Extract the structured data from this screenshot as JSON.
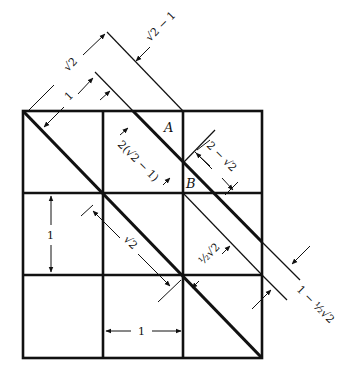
{
  "figure": {
    "type": "geometric diagram",
    "grid": {
      "rows": 3,
      "cols": 3
    },
    "points": [
      {
        "id": "A",
        "label": "A"
      },
      {
        "id": "B",
        "label": "B"
      }
    ],
    "dimensions": {
      "sqrt2_top": "√2",
      "one_top": "1",
      "sqrt2_minus_1": "√2 − 1",
      "two_sqrt2_minus_1": "2(√2 − 1)",
      "two_minus_sqrt2": "2 − √2",
      "one_left": "1",
      "sqrt2_middle": "√2",
      "half_sqrt2": "½√2",
      "one_minus_half_sqrt2": "1 − ½√2",
      "one_bottom": "1"
    }
  }
}
